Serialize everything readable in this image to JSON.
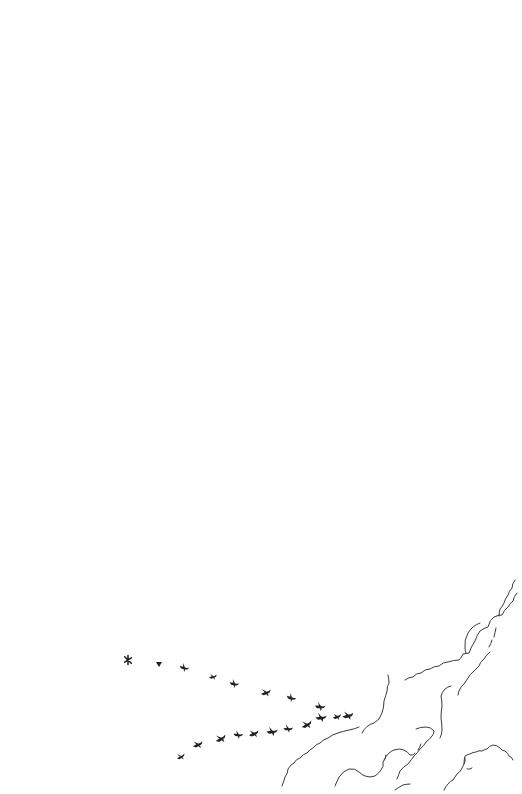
{
  "illustration": {
    "description": "Pen-and-ink sketch: a flock of birds flying in a V formation over scalloped cloud outlines",
    "background_color": "#ffffff",
    "ink_color": "#1f1f1f",
    "cloud_color": "#3a3a3a",
    "birds": {
      "count": 24,
      "upper_line": [
        {
          "x": 128,
          "y": 660
        },
        {
          "x": 159,
          "y": 664
        },
        {
          "x": 184,
          "y": 668
        },
        {
          "x": 213,
          "y": 677
        },
        {
          "x": 234,
          "y": 684
        },
        {
          "x": 266,
          "y": 693
        },
        {
          "x": 291,
          "y": 698
        },
        {
          "x": 320,
          "y": 707
        }
      ],
      "lower_line": [
        {
          "x": 181,
          "y": 757
        },
        {
          "x": 198,
          "y": 745
        },
        {
          "x": 221,
          "y": 739
        },
        {
          "x": 238,
          "y": 735
        },
        {
          "x": 254,
          "y": 734
        },
        {
          "x": 272,
          "y": 732
        },
        {
          "x": 288,
          "y": 729
        },
        {
          "x": 307,
          "y": 725
        },
        {
          "x": 321,
          "y": 718
        },
        {
          "x": 337,
          "y": 717
        },
        {
          "x": 348,
          "y": 716
        }
      ]
    },
    "clouds": {
      "count": 6
    }
  }
}
